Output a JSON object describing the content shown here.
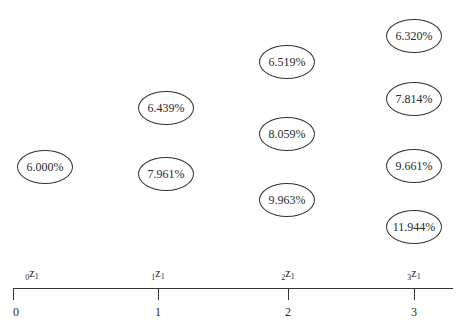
{
  "diagram": {
    "type": "interest-rate-tree",
    "nodes": [
      {
        "period": 0,
        "label": "6.000%",
        "x": 17,
        "y": 150
      },
      {
        "period": 1,
        "label": "6.439%",
        "x": 138,
        "y": 91
      },
      {
        "period": 1,
        "label": "7.961%",
        "x": 138,
        "y": 157
      },
      {
        "period": 2,
        "label": "6.519%",
        "x": 259,
        "y": 45
      },
      {
        "period": 2,
        "label": "8.059%",
        "x": 259,
        "y": 117
      },
      {
        "period": 2,
        "label": "9.963%",
        "x": 259,
        "y": 183
      },
      {
        "period": 3,
        "label": "6.320%",
        "x": 386,
        "y": 19
      },
      {
        "period": 3,
        "label": "7.814%",
        "x": 386,
        "y": 82
      },
      {
        "period": 3,
        "label": "9.661%",
        "x": 386,
        "y": 149
      },
      {
        "period": 3,
        "label": "11.944%",
        "x": 386,
        "y": 210
      }
    ],
    "timeline": {
      "ticks": [
        {
          "label": "0",
          "x": 14
        },
        {
          "label": "1",
          "x": 158
        },
        {
          "label": "2",
          "x": 288
        },
        {
          "label": "3",
          "x": 414
        }
      ],
      "rate_labels": [
        {
          "prefix": "0",
          "var": "z",
          "sub": "1",
          "x": 32
        },
        {
          "prefix": "1",
          "var": "z",
          "sub": "1",
          "x": 158
        },
        {
          "prefix": "2",
          "var": "z",
          "sub": "1",
          "x": 288
        },
        {
          "prefix": "3",
          "var": "z",
          "sub": "1",
          "x": 414
        }
      ]
    }
  }
}
